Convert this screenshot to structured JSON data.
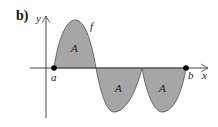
{
  "figure": {
    "panel_label": "b)",
    "y_axis_label": "y",
    "x_axis_label": "x",
    "function_label": "f",
    "point_a_label": "a",
    "point_b_label": "b",
    "region_labels": [
      "A",
      "A",
      "A"
    ]
  },
  "colors": {
    "fill": "#a6a6a6",
    "curve": "#6a6a6a",
    "axis": "#444444",
    "point": "#000000"
  }
}
